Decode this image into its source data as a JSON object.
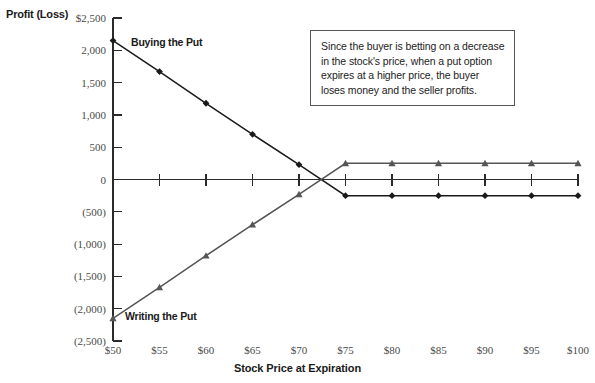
{
  "chart_data": {
    "type": "line",
    "title": "",
    "ylabel": "Profit (Loss)",
    "xlabel": "Stock Price at Expiration",
    "x": [
      50,
      55,
      60,
      65,
      70,
      75,
      80,
      85,
      90,
      95,
      100
    ],
    "xtick_labels": [
      "$50",
      "$55",
      "$60",
      "$65",
      "$70",
      "$75",
      "$80",
      "$85",
      "$90",
      "$95",
      "$100"
    ],
    "ytick_values": [
      2500,
      2000,
      1500,
      1000,
      500,
      0,
      -500,
      -1000,
      -1500,
      -2000,
      -2500
    ],
    "ytick_labels": [
      "$2,500",
      "2,000",
      "1,500",
      "1,000",
      "500",
      "0",
      "(500)",
      "(1,000)",
      "(1,500)",
      "(2,000)",
      "(2,500)"
    ],
    "ylim": [
      -2500,
      2500
    ],
    "xlim": [
      50,
      100
    ],
    "grid": false,
    "legend_position": "inline-series-labels",
    "series": [
      {
        "name": "Buying the Put",
        "marker": "diamond",
        "color": "#1a1a1a",
        "values": [
          2150,
          1670,
          1180,
          700,
          230,
          -250,
          -250,
          -250,
          -250,
          -250,
          -250
        ]
      },
      {
        "name": "Writing the Put",
        "marker": "triangle",
        "color": "#555555",
        "values": [
          -2150,
          -1670,
          -1180,
          -700,
          -230,
          250,
          250,
          250,
          250,
          250,
          250
        ]
      }
    ],
    "annotation": "Since the buyer is betting on a decrease in the stock's price, when a put option expires at a higher price, the buyer loses money and the seller profits."
  }
}
